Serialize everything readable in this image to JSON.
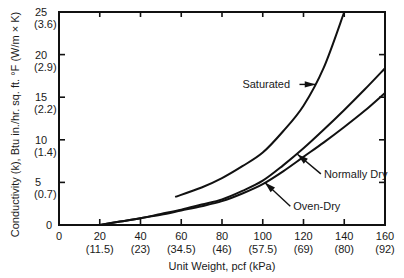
{
  "chart_data": {
    "type": "line",
    "title": "",
    "xlabel": "Unit Weight, pcf (kPa)",
    "ylabel": "Conductivity (k), Btu in./hr. sq. ft. °F (W/m × K)",
    "xlim": [
      0,
      160
    ],
    "ylim": [
      0,
      25
    ],
    "grid": false,
    "legend_position": "inline-annotations",
    "x_ticks": [
      {
        "value": 0,
        "label": "0",
        "sublabel": ""
      },
      {
        "value": 20,
        "label": "20",
        "sublabel": "(11.5)"
      },
      {
        "value": 40,
        "label": "40",
        "sublabel": "(23)"
      },
      {
        "value": 60,
        "label": "60",
        "sublabel": "(34.5)"
      },
      {
        "value": 80,
        "label": "80",
        "sublabel": "(46)"
      },
      {
        "value": 100,
        "label": "100",
        "sublabel": "(57.5)"
      },
      {
        "value": 120,
        "label": "120",
        "sublabel": "(69)"
      },
      {
        "value": 140,
        "label": "140",
        "sublabel": "(80)"
      },
      {
        "value": 160,
        "label": "160",
        "sublabel": "(92)"
      }
    ],
    "y_ticks": [
      {
        "value": 0,
        "label": "0",
        "sublabel": ""
      },
      {
        "value": 5,
        "label": "5",
        "sublabel": "(0.7)"
      },
      {
        "value": 10,
        "label": "10",
        "sublabel": "(1.4)"
      },
      {
        "value": 15,
        "label": "15",
        "sublabel": "(2.2)"
      },
      {
        "value": 20,
        "label": "20",
        "sublabel": "(2.9)"
      },
      {
        "value": 25,
        "label": "25",
        "sublabel": "(3.6)"
      }
    ],
    "series": [
      {
        "name": "Saturated",
        "x": [
          57,
          70,
          80,
          90,
          100,
          110,
          120,
          130,
          140
        ],
        "y": [
          3.3,
          4.4,
          5.5,
          6.9,
          8.5,
          11.0,
          14.0,
          18.5,
          25.0
        ]
      },
      {
        "name": "Normally Dry",
        "x": [
          20,
          30,
          40,
          50,
          60,
          70,
          80,
          90,
          100,
          110,
          120,
          130,
          140,
          150,
          160
        ],
        "y": [
          0.0,
          0.4,
          0.8,
          1.3,
          1.8,
          2.4,
          3.0,
          4.0,
          5.2,
          7.0,
          9.0,
          11.2,
          13.5,
          15.9,
          18.4
        ]
      },
      {
        "name": "Oven-Dry",
        "x": [
          20,
          30,
          40,
          50,
          60,
          70,
          80,
          90,
          100,
          110,
          120,
          130,
          140,
          150,
          160
        ],
        "y": [
          0.0,
          0.4,
          0.8,
          1.2,
          1.7,
          2.2,
          2.8,
          3.7,
          4.8,
          6.3,
          8.0,
          9.7,
          11.5,
          13.4,
          15.5
        ]
      }
    ],
    "annotations": [
      {
        "text": "Saturated",
        "label_at": [
          90,
          16.5
        ],
        "arrow_to": [
          126,
          16.5
        ]
      },
      {
        "text": "Normally Dry",
        "label_at": [
          130,
          6.0
        ],
        "arrow_to": [
          117,
          8.3
        ]
      },
      {
        "text": "Oven-Dry",
        "label_at": [
          115,
          2.2
        ],
        "arrow_to": [
          101,
          5.0
        ]
      }
    ]
  }
}
